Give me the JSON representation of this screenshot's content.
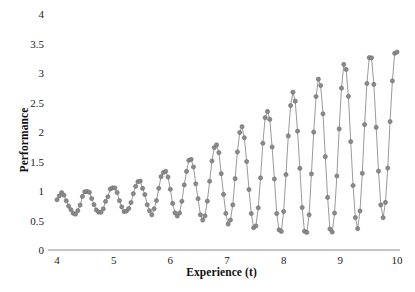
{
  "chart_data": {
    "type": "line",
    "title": "",
    "subtitle": "",
    "xlabel": "Experience (t)",
    "ylabel": "Performance",
    "xlim": [
      4,
      10
    ],
    "ylim": [
      0,
      4
    ],
    "xticks": [
      4,
      5,
      6,
      7,
      8,
      9,
      10
    ],
    "xtick_labels": [
      "4",
      "5",
      "6",
      "7",
      "8",
      "9",
      "10"
    ],
    "yticks": [
      0,
      0.5,
      1,
      1.5,
      2,
      2.5,
      3,
      3.5,
      4
    ],
    "ytick_labels": [
      "0",
      "0.5",
      "1",
      "1.5",
      "2",
      "2.5",
      "3",
      "3.5",
      "4"
    ],
    "grid": false,
    "legend": null,
    "marker": "circle",
    "marker_color": "#8a8a8a",
    "marker_edge_color": "#6f6f6f",
    "marker_size": 4.2,
    "line_color": "#8f8f8f",
    "line_width": 0.9,
    "axis_color": "#8d8d8d",
    "n_points": 148,
    "model": {
      "mean_base": 0.78,
      "mean_growth": 0.22,
      "mean_exp_gain": 1.05,
      "mean_exp_rate": 1.9,
      "carrier_freq": 13.2,
      "carrier_phase": 0.55,
      "envelope_base": 0.12,
      "envelope_beat_freq": 1.02,
      "envelope_beat_phase": 0.35,
      "envelope_growth": 0.085,
      "envelope_exp_gain": 1.25,
      "envelope_exp_rate": 1.75,
      "jitter_amplitude": 0.055,
      "jitter_seed": 20394
    },
    "series": [
      {
        "name": "Performance",
        "x": [],
        "values": []
      }
    ]
  },
  "axes": {
    "x_values": [
      4,
      5,
      6,
      7,
      8,
      9,
      10
    ],
    "y_values": [
      0,
      0.5,
      1,
      1.5,
      2,
      2.5,
      3,
      3.5,
      4
    ]
  },
  "caption": {
    "text": ""
  }
}
